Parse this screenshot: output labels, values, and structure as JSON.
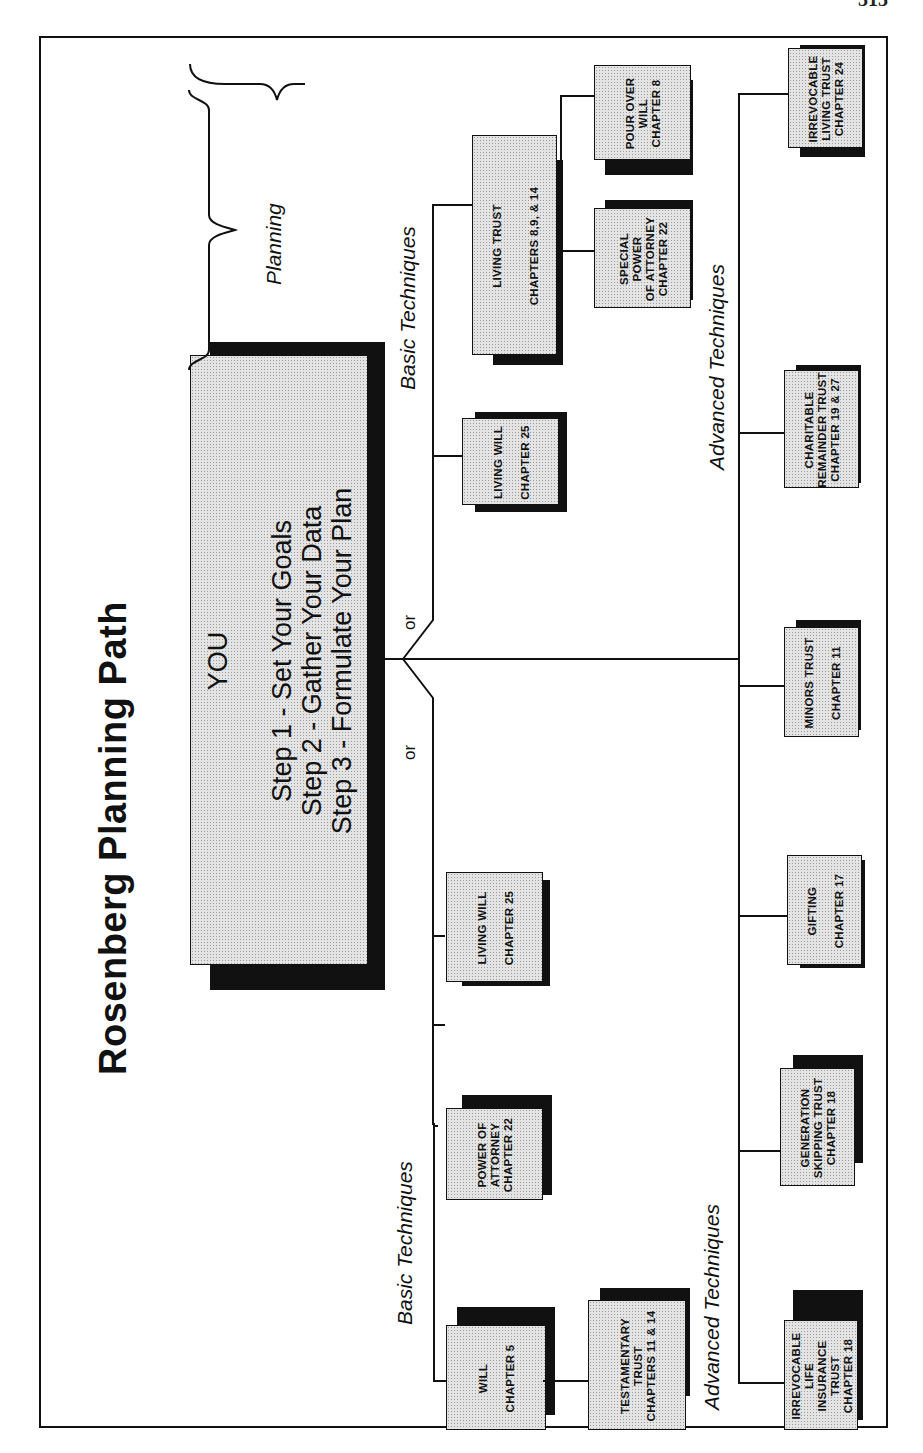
{
  "page": {
    "number": "313"
  },
  "diagram": {
    "title": "Rosenberg Planning Path",
    "planning_label": "Planning",
    "center": {
      "heading": "YOU",
      "steps": [
        "Step 1 - Set Your Goals",
        "Step 2 - Gather Your Data",
        "Step 3 - Formulate Your Plan"
      ]
    },
    "connector_labels": {
      "or_left": "or",
      "or_right": "or"
    },
    "sections": {
      "basic_left": "Basic Techniques",
      "basic_right": "Basic Techniques",
      "advanced_left": "Advanced Techniques",
      "advanced_right": "Advanced Techniques"
    },
    "basic_left_nodes": [
      {
        "lines": [
          "WILL",
          "CHAPTER 5"
        ]
      },
      {
        "lines": [
          "TESTAMENTARY",
          "TRUST",
          "CHAPTERS 11 & 14"
        ]
      },
      {
        "lines": [
          "POWER OF",
          "ATTORNEY",
          "CHAPTER 22"
        ]
      },
      {
        "lines": [
          "LIVING WILL",
          "CHAPTER 25"
        ]
      }
    ],
    "basic_right_nodes": [
      {
        "lines": [
          "LIVING WILL",
          "CHAPTER 25"
        ]
      },
      {
        "lines": [
          "LIVING TRUST",
          "CHAPTERS 8,9, & 14"
        ]
      },
      {
        "lines": [
          "SPECIAL POWER",
          "OF ATTORNEY",
          "CHAPTER 22"
        ]
      },
      {
        "lines": [
          "POUR OVER",
          "WILL",
          "CHAPTER 8"
        ]
      }
    ],
    "advanced_nodes": [
      {
        "lines": [
          "IRREVOCABLE LIFE",
          "INSURANCE TRUST",
          "CHAPTER 18"
        ]
      },
      {
        "lines": [
          "GENERATION",
          "SKIPPING TRUST",
          "CHAPTER 18"
        ]
      },
      {
        "lines": [
          "GIFTING",
          "CHAPTER 17"
        ]
      },
      {
        "lines": [
          "MINORS TRUST",
          "CHAPTER 11"
        ]
      },
      {
        "lines": [
          "CHARITABLE",
          "REMAINDER TRUST",
          "CHAPTER 19 & 27"
        ]
      },
      {
        "lines": [
          "IRREVOCABLE",
          "LIVING TRUST",
          "CHAPTER 24"
        ]
      }
    ]
  }
}
